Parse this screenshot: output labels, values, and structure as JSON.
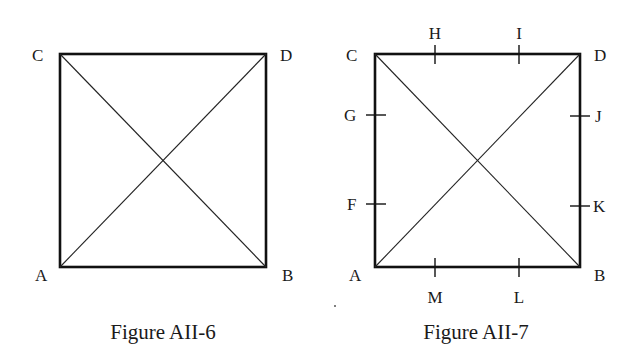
{
  "figures": [
    {
      "caption": "Figure AII-6",
      "square": {
        "left": 60,
        "top": 54,
        "right": 266,
        "bottom": 267
      },
      "corners": {
        "C": "C",
        "D": "D",
        "A": "A",
        "B": "B"
      },
      "diagonals": [
        "AD",
        "CB"
      ],
      "ticks": []
    },
    {
      "caption": "Figure AII-7",
      "square": {
        "left": 375,
        "top": 54,
        "right": 580,
        "bottom": 267
      },
      "corners": {
        "C": "C",
        "D": "D",
        "A": "A",
        "B": "B"
      },
      "diagonals": [
        "AD",
        "CB"
      ],
      "ticks": [
        {
          "label": "H",
          "side": "top"
        },
        {
          "label": "I",
          "side": "top"
        },
        {
          "label": "G",
          "side": "left"
        },
        {
          "label": "F",
          "side": "left"
        },
        {
          "label": "J",
          "side": "right"
        },
        {
          "label": "K",
          "side": "right"
        },
        {
          "label": "M",
          "side": "bottom"
        },
        {
          "label": "L",
          "side": "bottom"
        }
      ]
    }
  ],
  "colors": {
    "line": "#111111",
    "text": "#1a1a1a",
    "background": "#ffffff"
  }
}
